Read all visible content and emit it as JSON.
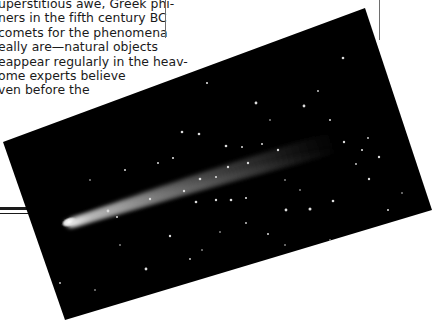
{
  "article": {
    "lines": [
      "uperstitious awe, Greek phi-",
      "ners in the fifth century BC",
      "comets for the phenomena",
      "eally are—natural objects",
      "eappear regularly in the heav-",
      "ome experts believe",
      "ven before the"
    ]
  },
  "photo": {
    "subject": "comet-photograph",
    "description": "Comet with bright nucleus and long tail against a star field",
    "colors": {
      "sky": "#000000",
      "tail": "#8a8a8a",
      "nucleus": "#f4f4f4",
      "stars": "#dcdcdc"
    }
  },
  "rules": {
    "color": "#1a1a1a",
    "column_rule_color": "#6e6e6e"
  }
}
